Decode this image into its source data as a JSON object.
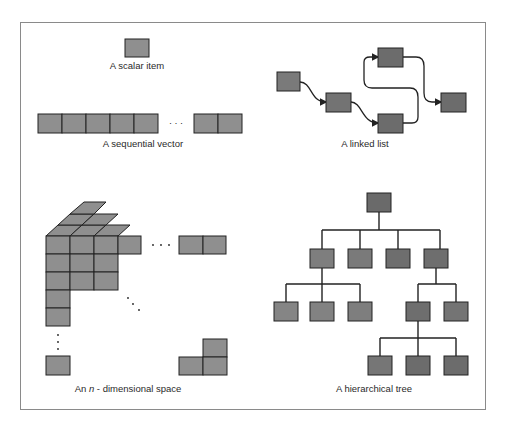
{
  "figure": {
    "frame_color": "#8a8a8a",
    "light_box_color": "#8f8f8f",
    "dark_box_color": "#6c6c6c",
    "stroke_color": "#222222"
  },
  "panels": {
    "scalar": {
      "label": "A scalar item"
    },
    "vector": {
      "label": "A sequential vector",
      "ellipsis": "· · ·"
    },
    "linked_list": {
      "label": "A linked list"
    },
    "n_space": {
      "label_prefix": "An ",
      "label_var": "n",
      "label_suffix": " - dimensional space"
    },
    "tree": {
      "label": "A hierarchical tree"
    }
  }
}
